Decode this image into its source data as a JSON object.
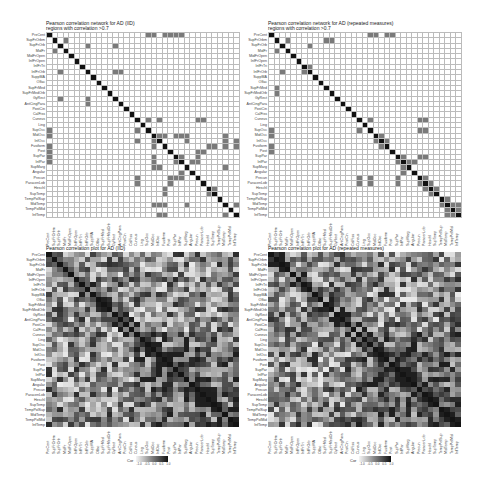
{
  "chart_data": [
    {
      "type": "heatmap",
      "id": "net-iid",
      "title": "Pearson correlation network for AD (IID)",
      "subtitle": "regions with correlation >0.7",
      "labels": [
        "PreCent",
        "SupFrOrbm",
        "SupFrOrb",
        "MidFr",
        "MidFrOpen",
        "InfFrOpen",
        "InfFrTri",
        "InfFrOrb",
        "SuppMA",
        "Olfac",
        "SupFrMed",
        "SupFrMedOrb",
        "GyRect",
        "AntCingPara",
        "PostCin",
        "CalFiss",
        "Cuneus",
        "Ling",
        "SupOcc",
        "MidOcc",
        "InfOcc",
        "Fusiform",
        "Post",
        "SupPar",
        "InfPar",
        "SupMarg",
        "Angular",
        "Precun",
        "ParacenLob",
        "Heschl",
        "SupTemp",
        "TempPolSup",
        "MidTemp",
        "TempPolMid",
        "InfTemp"
      ],
      "grid": true,
      "highlighted_cells": [
        [
          0,
          18
        ],
        [
          0,
          21
        ],
        [
          0,
          23
        ],
        [
          1,
          3
        ],
        [
          2,
          7
        ],
        [
          2,
          12
        ],
        [
          3,
          1
        ],
        [
          7,
          2
        ],
        [
          7,
          12
        ],
        [
          12,
          2
        ],
        [
          13,
          7
        ],
        [
          16,
          18
        ],
        [
          16,
          27
        ],
        [
          16,
          28
        ],
        [
          18,
          16
        ],
        [
          19,
          0
        ],
        [
          19,
          23
        ],
        [
          19,
          24
        ],
        [
          19,
          32
        ],
        [
          20,
          16
        ],
        [
          20,
          19
        ],
        [
          21,
          19
        ],
        [
          21,
          29
        ],
        [
          21,
          30
        ],
        [
          21,
          34
        ],
        [
          22,
          0
        ],
        [
          22,
          27
        ],
        [
          23,
          19
        ],
        [
          23,
          24
        ],
        [
          24,
          0
        ],
        [
          24,
          19
        ],
        [
          24,
          26
        ],
        [
          25,
          19
        ],
        [
          25,
          20
        ],
        [
          25,
          32
        ],
        [
          27,
          16
        ],
        [
          27,
          23
        ],
        [
          27,
          24
        ],
        [
          28,
          16
        ],
        [
          28,
          22
        ],
        [
          29,
          21
        ],
        [
          29,
          30
        ],
        [
          30,
          21
        ],
        [
          30,
          29
        ],
        [
          32,
          19
        ],
        [
          32,
          20
        ],
        [
          32,
          21
        ],
        [
          32,
          25
        ],
        [
          32,
          34
        ],
        [
          34,
          20
        ],
        [
          34,
          21
        ],
        [
          34,
          32
        ]
      ]
    },
    {
      "type": "heatmap",
      "id": "net-rm",
      "title": "Pearson correlation network for AD (repeated measures)",
      "subtitle": "regions with correlation >0.7",
      "labels": [
        "PreCent",
        "SupFrOrbm",
        "SupFrOrb",
        "MidFr",
        "MidFrOpen",
        "InfFrOpen",
        "InfFrTri",
        "InfFrOrb",
        "SuppMA",
        "Olfac",
        "SupFrMed",
        "SupFrMedOrb",
        "GyRect",
        "AntCingPara",
        "PostCin",
        "CalFiss",
        "Cuneus",
        "Ling",
        "SupOcc",
        "MidOcc",
        "InfOcc",
        "Fusiform",
        "Post",
        "SupPar",
        "InfPar",
        "SupMarg",
        "Angular",
        "Precun",
        "ParacenLob",
        "Heschl",
        "SupTemp",
        "TempPolSup",
        "MidTemp",
        "TempPolMid",
        "InfTemp"
      ],
      "grid": true,
      "highlighted_cells": [
        [
          0,
          18
        ],
        [
          0,
          21
        ],
        [
          1,
          3
        ],
        [
          1,
          10
        ],
        [
          2,
          7
        ],
        [
          3,
          1
        ],
        [
          6,
          6
        ],
        [
          6,
          7
        ],
        [
          7,
          2
        ],
        [
          7,
          6
        ],
        [
          11,
          1
        ],
        [
          16,
          18
        ],
        [
          16,
          27
        ],
        [
          16,
          28
        ],
        [
          18,
          16
        ],
        [
          18,
          27
        ],
        [
          19,
          0
        ],
        [
          19,
          20
        ],
        [
          20,
          19
        ],
        [
          20,
          21
        ],
        [
          21,
          20
        ],
        [
          22,
          0
        ],
        [
          23,
          24
        ],
        [
          23,
          27
        ],
        [
          24,
          23
        ],
        [
          24,
          25
        ],
        [
          24,
          26
        ],
        [
          25,
          24
        ],
        [
          26,
          24
        ],
        [
          28,
          16
        ],
        [
          28,
          18
        ],
        [
          28,
          23
        ],
        [
          28,
          27
        ],
        [
          29,
          28
        ],
        [
          30,
          29
        ],
        [
          31,
          32
        ],
        [
          32,
          31
        ],
        [
          32,
          33
        ],
        [
          33,
          32
        ],
        [
          33,
          34
        ],
        [
          34,
          32
        ]
      ]
    },
    {
      "type": "heatmap",
      "id": "cor-iid",
      "title": "Pearson correlation plot for AD (IID)",
      "labels": [
        "PreCent",
        "SupFrOrbm",
        "SupFrOrb",
        "MidFr",
        "MidFrOpen",
        "InfFrOpen",
        "InfFrTri",
        "InfFrOrb",
        "SuppMA",
        "Olfac",
        "SupFrMed",
        "SupFrMedOrb",
        "GyRect",
        "AntCingPara",
        "PostCin",
        "CalFiss",
        "Cuneus",
        "Ling",
        "SupOcc",
        "MidOcc",
        "InfOcc",
        "Fusiform",
        "Post",
        "SupPar",
        "InfPar",
        "SupMarg",
        "Angular",
        "Precun",
        "ParacenLob",
        "Heschl",
        "SupTemp",
        "TempPolSup",
        "MidTemp",
        "TempPolMid",
        "InfTemp"
      ],
      "legend": {
        "title": "Cor",
        "ticks": [
          "-1.0",
          "-0.5",
          "0.0",
          "0.5",
          "1.0"
        ]
      },
      "value_range": [
        -1,
        1
      ],
      "seed": 7
    },
    {
      "type": "heatmap",
      "id": "cor-rm",
      "title": "Pearson correlation plot for AD (repeated measures)",
      "labels": [
        "PreCent",
        "SupFrOrbm",
        "SupFrOrb",
        "MidFr",
        "MidFrOpen",
        "InfFrOpen",
        "InfFrTri",
        "InfFrOrb",
        "SuppMA",
        "Olfac",
        "SupFrMed",
        "SupFrMedOrb",
        "GyRect",
        "AntCingPara",
        "PostCin",
        "CalFiss",
        "Cuneus",
        "Ling",
        "SupOcc",
        "MidOcc",
        "InfOcc",
        "Fusiform",
        "Post",
        "SupPar",
        "InfPar",
        "SupMarg",
        "Angular",
        "Precun",
        "ParacenLob",
        "Heschl",
        "SupTemp",
        "TempPolSup",
        "MidTemp",
        "TempPolMid",
        "InfTemp"
      ],
      "legend": {
        "title": "Cor",
        "ticks": [
          "-1.0",
          "-0.5",
          "0.0",
          "0.5",
          "1.0"
        ]
      },
      "value_range": [
        -1,
        1
      ],
      "seed": 11
    }
  ],
  "colors": {
    "diagonal": "#111111",
    "highlight": "#7a7a7a",
    "grid_line": "#bbbbbb",
    "background": "#ffffff"
  }
}
